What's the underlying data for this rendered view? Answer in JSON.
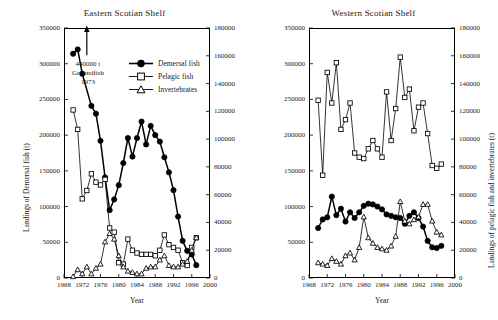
{
  "figure": {
    "width": 498,
    "height": 320,
    "background": "#ffffff",
    "line_color": "#000000"
  },
  "panels": [
    {
      "id": "eastern",
      "title": "Eastern Scotian Shelf",
      "xlabel": "Year",
      "ylabel_left": "Landings of Demersal fish (t)",
      "ylabel_right": "",
      "annotation": {
        "line1": "440000 t",
        "line2": "Groundfish",
        "line3": "1973"
      },
      "legend": [
        {
          "label": "Demersal fish",
          "marker": "filled-circle"
        },
        {
          "label": "Pelagic fish",
          "marker": "open-square"
        },
        {
          "label": "Invertebrates",
          "marker": "open-triangle"
        }
      ]
    },
    {
      "id": "western",
      "title": "Western Scotian Shelf",
      "xlabel": "Year",
      "ylabel_left": "",
      "ylabel_right": "Landings of pelagic fish and invertebrates (t)",
      "annotation": null,
      "legend": []
    }
  ],
  "chart_data": [
    {
      "type": "line",
      "panel": "eastern",
      "title": "Eastern Scotian Shelf",
      "xlabel": "Year",
      "ylabel": "Landings of Demersal fish (t)",
      "ylabel_secondary": "Landings of pelagic fish and invertebrates (t)",
      "xlim": [
        1968,
        2000
      ],
      "xticks": [
        1968,
        1972,
        1976,
        1980,
        1984,
        1988,
        1992,
        1996,
        2000
      ],
      "ylim": [
        0,
        350000
      ],
      "yticks": [
        0,
        50000,
        100000,
        150000,
        200000,
        250000,
        300000,
        350000
      ],
      "ylim_secondary": [
        0,
        180000
      ],
      "yticks_secondary": [
        0,
        20000,
        40000,
        60000,
        80000,
        100000,
        120000,
        140000,
        160000,
        180000
      ],
      "grid": false,
      "legend_position": "upper-center",
      "annotation": "440000 t Groundfish 1973",
      "annotation_arrow": {
        "x": 1973,
        "y_from": 312000,
        "y_to": 348000
      },
      "series": [
        {
          "name": "Demersal fish",
          "axis": "left",
          "marker": "filled-circle",
          "x": [
            1970,
            1971,
            1972,
            1974,
            1975,
            1976,
            1977,
            1978,
            1979,
            1980,
            1981,
            1982,
            1983,
            1984,
            1985,
            1986,
            1987,
            1988,
            1989,
            1990,
            1991,
            1992,
            1993,
            1994,
            1995,
            1996,
            1997
          ],
          "values": [
            314000,
            320000,
            286000,
            241000,
            230000,
            192000,
            141000,
            95000,
            110000,
            130000,
            161000,
            196000,
            170000,
            196000,
            219000,
            187000,
            213000,
            200000,
            191000,
            169000,
            148000,
            123000,
            86000,
            52000,
            38000,
            33000,
            18000
          ]
        },
        {
          "name": "Pelagic fish",
          "axis": "right",
          "marker": "open-square",
          "x": [
            1970,
            1971,
            1972,
            1973,
            1974,
            1975,
            1976,
            1977,
            1978,
            1979,
            1980,
            1981,
            1982,
            1983,
            1984,
            1985,
            1986,
            1987,
            1988,
            1989,
            1990,
            1991,
            1992,
            1993,
            1994,
            1995,
            1996,
            1997
          ],
          "values": [
            121000,
            107000,
            57000,
            63000,
            75000,
            69000,
            67000,
            71000,
            36000,
            33000,
            11000,
            10000,
            28000,
            20000,
            18000,
            17000,
            17000,
            17000,
            16000,
            20000,
            31000,
            24000,
            22000,
            20000,
            11000,
            9000,
            22000,
            29000
          ]
        },
        {
          "name": "Invertebrates",
          "axis": "right",
          "marker": "open-triangle",
          "x": [
            1970,
            1971,
            1972,
            1973,
            1974,
            1975,
            1976,
            1977,
            1978,
            1979,
            1980,
            1981,
            1982,
            1983,
            1984,
            1985,
            1986,
            1987,
            1988,
            1989,
            1990,
            1991,
            1992,
            1993,
            1994,
            1995,
            1996,
            1997
          ],
          "values": [
            1000,
            6000,
            3000,
            8000,
            3000,
            7000,
            10000,
            26000,
            32000,
            28000,
            16000,
            8000,
            5000,
            4000,
            3000,
            3000,
            7000,
            8000,
            8000,
            13000,
            16000,
            9000,
            8000,
            8000,
            10000,
            12000,
            20000,
            29000
          ]
        }
      ]
    },
    {
      "type": "line",
      "panel": "western",
      "title": "Western Scotian Shelf",
      "xlabel": "Year",
      "ylabel": "Landings of Demersal fish (t)",
      "ylabel_secondary": "Landings of pelagic fish and invertebrates (t)",
      "xlim": [
        1968,
        2000
      ],
      "xticks": [
        1968,
        1972,
        1976,
        1980,
        1984,
        1988,
        1992,
        1996,
        2000
      ],
      "ylim": [
        0,
        350000
      ],
      "yticks": [
        0,
        50000,
        100000,
        150000,
        200000,
        250000,
        300000,
        350000
      ],
      "ylim_secondary": [
        0,
        180000
      ],
      "yticks_secondary": [
        0,
        20000,
        40000,
        60000,
        80000,
        100000,
        120000,
        140000,
        160000,
        180000
      ],
      "grid": false,
      "legend_position": "none",
      "series": [
        {
          "name": "Pelagic fish",
          "axis": "right",
          "marker": "open-square",
          "x": [
            1970,
            1971,
            1972,
            1973,
            1974,
            1975,
            1976,
            1977,
            1978,
            1979,
            1980,
            1981,
            1982,
            1983,
            1984,
            1985,
            1986,
            1987,
            1988,
            1989,
            1990,
            1991,
            1992,
            1993,
            1994,
            1995,
            1996,
            1997
          ],
          "values": [
            128000,
            74000,
            148000,
            126000,
            155000,
            107000,
            114000,
            126000,
            90000,
            87000,
            86000,
            93000,
            99000,
            93000,
            87000,
            134000,
            99000,
            122000,
            159000,
            130000,
            136000,
            106000,
            123000,
            126000,
            104000,
            81000,
            79000,
            82000
          ]
        },
        {
          "name": "Demersal fish",
          "axis": "left",
          "marker": "filled-circle",
          "x": [
            1970,
            1971,
            1972,
            1973,
            1974,
            1975,
            1976,
            1977,
            1978,
            1979,
            1980,
            1981,
            1982,
            1983,
            1984,
            1985,
            1986,
            1987,
            1988,
            1989,
            1990,
            1991,
            1992,
            1993,
            1994,
            1995,
            1996,
            1997
          ],
          "values": [
            70000,
            82000,
            85000,
            114000,
            88000,
            97000,
            79000,
            92000,
            84000,
            92000,
            101000,
            104000,
            103000,
            100000,
            96000,
            89000,
            87000,
            85000,
            84000,
            76000,
            87000,
            92000,
            84000,
            72000,
            52000,
            43000,
            42000,
            45000
          ]
        },
        {
          "name": "Invertebrates",
          "axis": "right",
          "marker": "open-triangle",
          "x": [
            1970,
            1971,
            1972,
            1973,
            1974,
            1975,
            1976,
            1977,
            1978,
            1979,
            1980,
            1981,
            1982,
            1983,
            1984,
            1985,
            1986,
            1987,
            1988,
            1989,
            1990,
            1991,
            1992,
            1993,
            1994,
            1995,
            1996,
            1997
          ],
          "values": [
            11000,
            10000,
            9000,
            14000,
            12000,
            10000,
            16000,
            18000,
            13000,
            22000,
            44000,
            29000,
            25000,
            22000,
            21000,
            20000,
            23000,
            30000,
            55000,
            41000,
            39000,
            42000,
            44000,
            53000,
            53000,
            41000,
            33000,
            31000
          ]
        }
      ]
    }
  ]
}
